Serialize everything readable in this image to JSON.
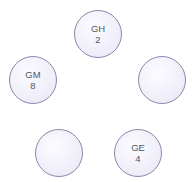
{
  "diagram": {
    "nodes": [
      {
        "id": "top",
        "name": "GH",
        "value": "2",
        "cx": 98,
        "cy": 34
      },
      {
        "id": "left",
        "name": "GM",
        "value": "8",
        "cx": 33,
        "cy": 80
      },
      {
        "id": "right",
        "name": "",
        "value": "",
        "cx": 162,
        "cy": 80
      },
      {
        "id": "bottom-left",
        "name": "",
        "value": "",
        "cx": 59,
        "cy": 153
      },
      {
        "id": "bottom-right",
        "name": "GE",
        "value": "4",
        "cx": 138,
        "cy": 153
      }
    ],
    "colors": {
      "node_border": "#8e86ac",
      "node_fill": "#f1f0fa",
      "label_text": "#555560"
    }
  }
}
